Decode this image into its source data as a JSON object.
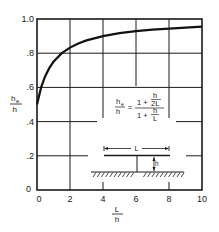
{
  "chart_data": {
    "type": "line",
    "title": "",
    "xlabel": {
      "num": "L",
      "den": "h"
    },
    "ylabel": {
      "num": "h",
      "num_sub": "e",
      "den": "h"
    },
    "xlim": [
      0,
      10
    ],
    "ylim": [
      0,
      1.0
    ],
    "grid": true,
    "x_ticks": [
      0,
      2,
      4,
      6,
      8,
      10
    ],
    "x_tick_labels": [
      "0",
      "2",
      "4",
      "6",
      "8",
      "10"
    ],
    "y_ticks": [
      0,
      0.2,
      0.4,
      0.6,
      0.8,
      1.0
    ],
    "y_tick_labels": [
      "0",
      ".2",
      ".4",
      ".6",
      ".8",
      "1.0"
    ],
    "series": [
      {
        "name": "he/h",
        "formula": "he/h = (1 + h/2L) / (1 + h/L)",
        "x": [
          0,
          0.25,
          0.5,
          0.75,
          1,
          1.5,
          2,
          2.5,
          3,
          4,
          5,
          6,
          7,
          8,
          9,
          10
        ],
        "y": [
          0.5,
          0.6,
          0.667,
          0.714,
          0.75,
          0.8,
          0.833,
          0.857,
          0.875,
          0.9,
          0.917,
          0.929,
          0.938,
          0.944,
          0.95,
          0.955
        ]
      }
    ],
    "annotations": {
      "formula": {
        "lhs_num": "h",
        "lhs_sub": "e",
        "lhs_den": "h",
        "eq": "=",
        "rhs_num_prefix": "1 +",
        "rhs_num_frac_num": "h",
        "rhs_num_frac_den": "2L",
        "rhs_den_prefix": "1 +",
        "rhs_den_frac_num": "h",
        "rhs_den_frac_den": "L"
      },
      "diagram": {
        "span_label": "L",
        "height_label": "h"
      }
    }
  }
}
